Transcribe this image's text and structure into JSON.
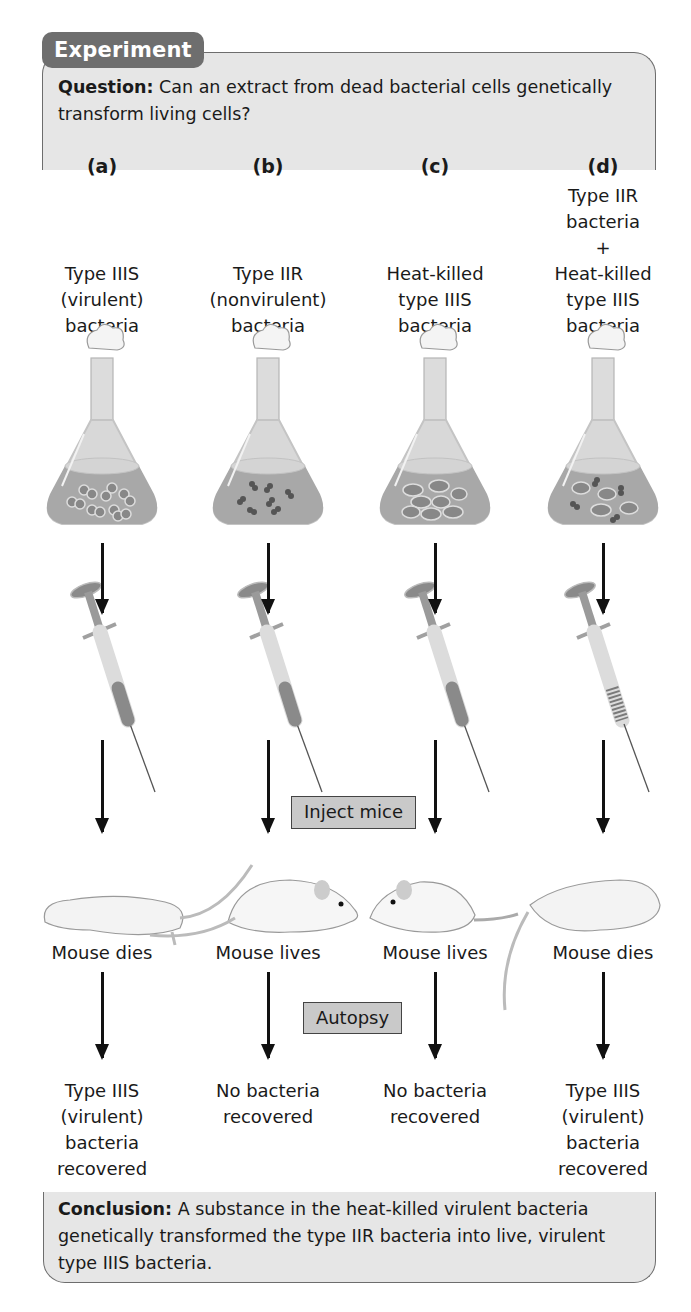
{
  "header": {
    "tab_label": "Experiment",
    "question_label": "Question:",
    "question_text": " Can an extract from dead bacterial cells genetically transform living cells?"
  },
  "columns": [
    {
      "label": "(a)",
      "culture_lines": [
        "Type IIIS",
        "(virulent)",
        "bacteria"
      ],
      "flask_contents": "encapsulated-paired-cells",
      "syringe_fill": "solid",
      "mouse_state": "dead",
      "mouse_result": "Mouse dies",
      "outcome_lines": [
        "Type IIIS",
        "(virulent)",
        "bacteria",
        "recovered"
      ]
    },
    {
      "label": "(b)",
      "culture_lines": [
        "Type IIR",
        "(nonvirulent)",
        "bacteria"
      ],
      "flask_contents": "small-paired-cells",
      "syringe_fill": "solid",
      "mouse_state": "alive",
      "mouse_result": "Mouse lives",
      "outcome_lines": [
        "No bacteria",
        "recovered"
      ]
    },
    {
      "label": "(c)",
      "culture_lines": [
        "Heat-killed",
        "type IIIS",
        "bacteria"
      ],
      "flask_contents": "ruptured-capsule-cells",
      "syringe_fill": "solid",
      "mouse_state": "alive",
      "mouse_result": "Mouse lives",
      "outcome_lines": [
        "No bacteria",
        "recovered"
      ]
    },
    {
      "label": "(d)",
      "culture_lines": [
        "Type IIR",
        "bacteria",
        "+",
        "Heat-killed",
        "type IIIS",
        "bacteria"
      ],
      "flask_contents": "mixed-cells",
      "syringe_fill": "striped",
      "mouse_state": "dead",
      "mouse_result": "Mouse dies",
      "outcome_lines": [
        "Type IIIS",
        "(virulent)",
        "bacteria",
        "recovered"
      ]
    }
  ],
  "steps": {
    "inject": "Inject mice",
    "autopsy": "Autopsy"
  },
  "conclusion": {
    "label": "Conclusion:",
    "text": " A substance in the heat-killed virulent bacteria genetically transformed the type IIR bacteria into live, virulent type IIIS bacteria."
  },
  "colors": {
    "box_fill": "#e6e6e6",
    "tab_fill": "#6e6e6e",
    "step_box_fill": "#c9c9c9",
    "flask_liquid": "#a8a8a8",
    "arrow": "#111111"
  }
}
